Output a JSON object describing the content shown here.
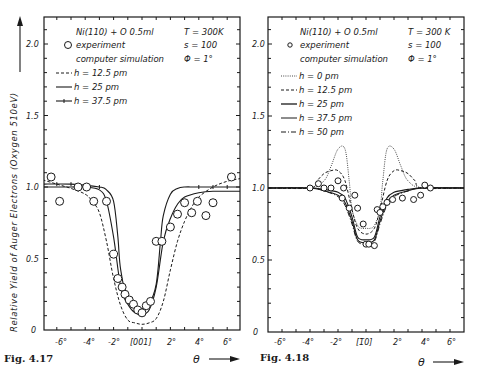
{
  "chart_data": [
    {
      "type": "line",
      "figure_label": "Fig. 4.17",
      "title_lines": [
        "Ni(110) + O  0.5ml",
        "T = 300K",
        "s = 100",
        "Φ = 1°"
      ],
      "ylabel": "Relative Yield of Auger Electrons (Oxygen 510eV)",
      "xlabel": "θ",
      "x_tick_labels": [
        "-6°",
        "-4°",
        "-2°",
        "[001]",
        "2°",
        "4°",
        "6°"
      ],
      "x_ticks": [
        -6,
        -4,
        -2,
        0,
        2,
        4,
        6
      ],
      "y_tick_labels": [
        "0",
        "0.5",
        "1.0",
        "1.5",
        "2.0"
      ],
      "y_ticks": [
        0,
        0.5,
        1.0,
        1.5,
        2.0
      ],
      "xlim": [
        -7,
        7
      ],
      "ylim": [
        0,
        2.2
      ],
      "legend": [
        "experiment",
        "computer simulation",
        "h = 12.5 pm",
        "h = 25   pm",
        "h = 37.5 pm"
      ],
      "legend_position": "upper left",
      "series": [
        {
          "name": "experiment",
          "style": "circle",
          "x": [
            -6.4,
            -5.8,
            -4.5,
            -3.9,
            -3.4,
            -2.5,
            -2.0,
            -1.7,
            -1.4,
            -1.2,
            -0.9,
            -0.6,
            -0.3,
            0.0,
            0.3,
            0.6,
            1.0,
            1.4,
            2.0,
            2.5,
            3.0,
            3.5,
            3.9,
            4.5,
            5.0,
            6.3
          ],
          "y": [
            1.07,
            0.9,
            1.0,
            1.0,
            0.9,
            0.9,
            0.53,
            0.36,
            0.3,
            0.25,
            0.21,
            0.18,
            0.14,
            0.12,
            0.17,
            0.2,
            0.62,
            0.62,
            0.72,
            0.81,
            0.89,
            0.82,
            0.9,
            0.8,
            0.89,
            1.07
          ]
        },
        {
          "name": "h = 12.5 pm",
          "style": "dashed",
          "x": [
            -7,
            -6,
            -5,
            -4,
            -3.5,
            -3,
            -2.5,
            -2,
            -1.5,
            -1,
            -0.5,
            0,
            0.5,
            1,
            1.5,
            2,
            2.5,
            3,
            3.5,
            4,
            5,
            6,
            7
          ],
          "y": [
            1.05,
            1.02,
            0.99,
            0.95,
            0.9,
            0.82,
            0.62,
            0.36,
            0.17,
            0.07,
            0.05,
            0.04,
            0.05,
            0.08,
            0.2,
            0.42,
            0.62,
            0.76,
            0.86,
            0.93,
            1.0,
            1.04,
            1.06
          ]
        },
        {
          "name": "h = 25 pm",
          "style": "solid",
          "x": [
            -7,
            -5,
            -4,
            -3,
            -2.5,
            -2,
            -1.5,
            -1,
            -0.5,
            0,
            0.5,
            1,
            1.5,
            2,
            2.5,
            3,
            4,
            5,
            7
          ],
          "y": [
            1.0,
            1.0,
            1.0,
            0.98,
            0.9,
            0.65,
            0.3,
            0.18,
            0.12,
            0.11,
            0.14,
            0.3,
            0.62,
            0.78,
            0.88,
            0.93,
            0.96,
            0.97,
            0.97
          ]
        },
        {
          "name": "h = 37.5 pm",
          "style": "solid-with-ticks",
          "x": [
            -7,
            -5,
            -3,
            -2.5,
            -2,
            -1.7,
            -1.5,
            -1,
            -0.5,
            0,
            0.5,
            1,
            1.3,
            1.5,
            2,
            2.5,
            3,
            4,
            7
          ],
          "y": [
            1.02,
            1.02,
            1.0,
            0.98,
            0.9,
            0.65,
            0.42,
            0.2,
            0.16,
            0.15,
            0.18,
            0.32,
            0.62,
            0.8,
            0.95,
            0.99,
            1.0,
            1.0,
            1.0
          ]
        }
      ]
    },
    {
      "type": "line",
      "figure_label": "Fig. 4.18",
      "title_lines": [
        "Ni(110) + O  0.5ml",
        "T = 300 K",
        "s = 100",
        "Φ = 1°"
      ],
      "ylabel": "",
      "xlabel": "θ",
      "x_tick_labels": [
        "-6°",
        "-4°",
        "-2°",
        "[1̅0]",
        "2°",
        "4°",
        "6°"
      ],
      "x_tick_text": [
        "-6°",
        "-4°",
        "-2°",
        "[1",
        "1̄",
        "0]",
        "2°",
        "4°",
        "6°"
      ],
      "x_ticks": [
        -6,
        -4,
        -2,
        0,
        2,
        4,
        6
      ],
      "y_tick_labels": [
        "0",
        "0.5",
        "1.0",
        "1.5",
        "2.0"
      ],
      "y_ticks": [
        0,
        0.5,
        1.0,
        1.5,
        2.0
      ],
      "xlim": [
        -7,
        7
      ],
      "ylim": [
        0,
        2.2
      ],
      "legend": [
        "experiment",
        "computer simulation",
        "h =  0   pm",
        "h = 12.5 pm",
        "h = 25   pm",
        "h = 37.5 pm",
        "h = 50   pm"
      ],
      "legend_position": "upper left",
      "series": [
        {
          "name": "experiment",
          "style": "circle",
          "x": [
            -4.0,
            -3.4,
            -3.0,
            -2.5,
            -2.0,
            -1.7,
            -1.6,
            -1.2,
            -0.8,
            -0.6,
            -0.2,
            0.0,
            0.2,
            0.6,
            0.8,
            1.0,
            1.2,
            1.5,
            1.9,
            2.6,
            3.4,
            3.9,
            4.2,
            4.6
          ],
          "y": [
            1.0,
            1.03,
            1.0,
            1.0,
            1.05,
            0.93,
            1.0,
            0.86,
            0.95,
            0.86,
            0.75,
            0.61,
            0.61,
            0.6,
            0.85,
            0.83,
            0.87,
            0.9,
            0.92,
            0.93,
            0.92,
            0.95,
            1.02,
            1.0
          ]
        },
        {
          "name": "h = 0 pm",
          "style": "dotted",
          "x": [
            -7,
            -4,
            -3,
            -2.5,
            -2,
            -1.5,
            -1.2,
            -1,
            -0.6,
            -0.3,
            0,
            0.3,
            0.6,
            1,
            1.2,
            1.5,
            2,
            2.5,
            3,
            4,
            7
          ],
          "y": [
            1.0,
            1.0,
            1.05,
            1.15,
            1.27,
            1.27,
            1.05,
            0.85,
            0.74,
            0.72,
            0.72,
            0.72,
            0.74,
            0.85,
            1.05,
            1.27,
            1.27,
            1.15,
            1.05,
            1.0,
            1.0
          ]
        },
        {
          "name": "h = 12.5 pm",
          "style": "dashed",
          "x": [
            -7,
            -4,
            -3.5,
            -3,
            -2.5,
            -2,
            -1.5,
            -1,
            -0.6,
            0,
            0.6,
            1,
            1.5,
            2,
            2.5,
            3,
            3.5,
            4,
            7
          ],
          "y": [
            1.0,
            1.0,
            1.05,
            1.1,
            1.12,
            1.12,
            1.05,
            0.85,
            0.72,
            0.68,
            0.72,
            0.85,
            1.05,
            1.12,
            1.12,
            1.1,
            1.05,
            1.0,
            1.0
          ]
        },
        {
          "name": "h = 25 pm",
          "style": "solid",
          "x": [
            -7,
            -4,
            -3,
            -2,
            -1.5,
            -1,
            -0.6,
            0,
            0.6,
            1,
            1.5,
            2,
            3,
            4,
            7
          ],
          "y": [
            1.0,
            1.0,
            0.99,
            0.97,
            0.93,
            0.8,
            0.66,
            0.64,
            0.66,
            0.8,
            0.93,
            0.97,
            0.99,
            1.0,
            1.0
          ]
        },
        {
          "name": "h = 37.5 pm",
          "style": "solid",
          "x": [
            -7,
            -4,
            -3,
            -2,
            -1.5,
            -1,
            -0.6,
            0,
            0.6,
            1,
            1.5,
            2,
            3,
            4,
            7
          ],
          "y": [
            1.0,
            1.0,
            0.98,
            0.95,
            0.9,
            0.77,
            0.64,
            0.62,
            0.64,
            0.77,
            0.9,
            0.95,
            0.98,
            1.0,
            1.0
          ]
        },
        {
          "name": "h = 50 pm",
          "style": "dash-dot",
          "x": [
            -7,
            -4,
            -3,
            -2,
            -1.5,
            -1,
            -0.6,
            0,
            0.6,
            1,
            1.5,
            2,
            3,
            4,
            7
          ],
          "y": [
            1.0,
            1.0,
            0.98,
            0.94,
            0.88,
            0.75,
            0.63,
            0.61,
            0.63,
            0.75,
            0.88,
            0.94,
            0.98,
            1.0,
            1.0
          ]
        }
      ]
    }
  ],
  "left": {
    "title": "Ni(110) + O   0.5ml",
    "temp": "T = 300K",
    "s": "s = 100",
    "phi": "Φ = 1°",
    "legend_experiment": "experiment",
    "legend_sim": "computer  simulation",
    "legend_h1": "h = 12.5 pm",
    "legend_h2": "h = 25    pm",
    "legend_h3": "h = 37.5 pm",
    "ylabel": "Relative  Yield  of  Auger  Electrons   (Oxygen  510eV)",
    "fig": "Fig. 4.17",
    "theta": "θ",
    "yticks": [
      "0",
      "0.5",
      "1.0",
      "1.5",
      "2.0"
    ],
    "xticks": [
      "-6°",
      "-4°",
      "-2°",
      "[001]",
      "2°",
      "4°",
      "6°"
    ]
  },
  "right": {
    "title": "Ni(110) + O   0.5ml",
    "temp": "T = 300 K",
    "s": "s = 100",
    "phi": "Φ = 1°",
    "legend_experiment": "experiment",
    "legend_sim": "computer  simulation",
    "legend_h0": "h =  0    pm",
    "legend_h1": "h = 12.5 pm",
    "legend_h2": "h = 25    pm",
    "legend_h3": "h = 37.5 pm",
    "legend_h4": "h = 50    pm",
    "fig": "Fig. 4.18",
    "theta": "θ",
    "yticks": [
      "0",
      "0.5",
      "1.0",
      "1.5",
      "2.0"
    ],
    "xticks": [
      "-6°",
      "-4°",
      "-2°",
      "[1̅0]",
      "2°",
      "4°",
      "6°"
    ]
  }
}
